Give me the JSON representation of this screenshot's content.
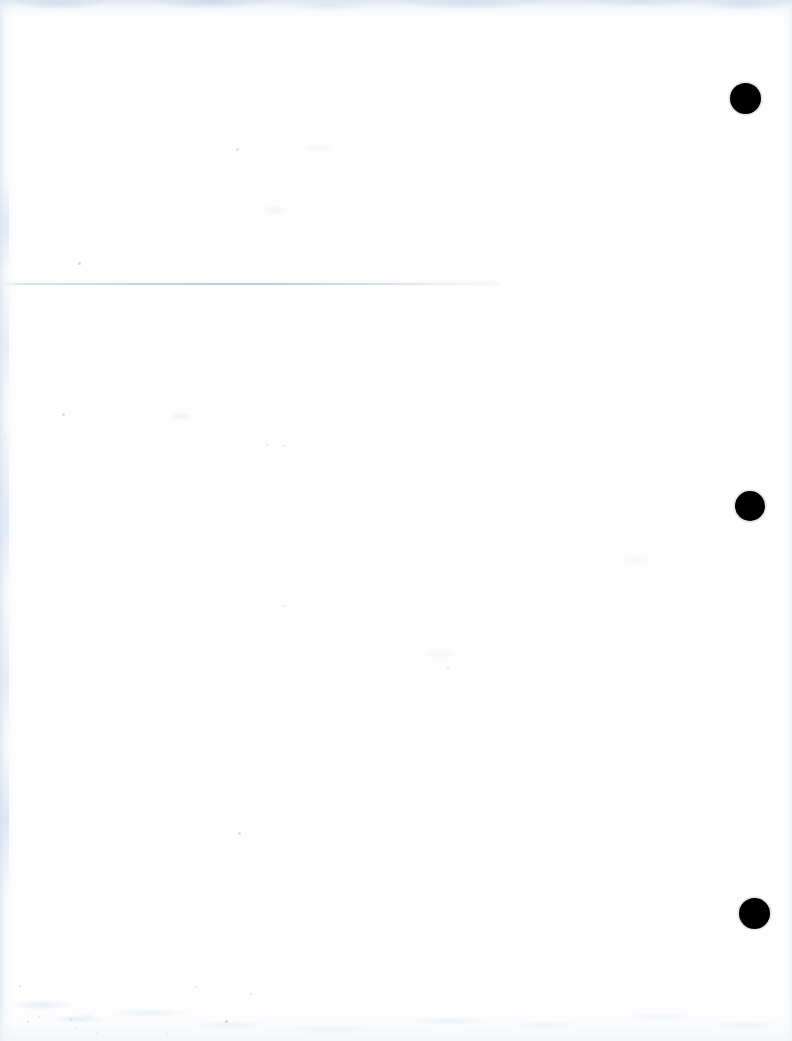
{
  "document": {
    "title": "Scanned Blank Page",
    "page_width": 792,
    "page_height": 1041,
    "background_color": "#ffffff",
    "paper_color": "#fefeff",
    "content_text": "",
    "description": "Blank scanned document page with three black binding marks along the right margin and a faint horizontal fold crease across the upper third."
  },
  "marks": {
    "ink_color": "#000000",
    "registration_dots": [
      {
        "id": "dot-1",
        "label": "",
        "cx": 745,
        "cy": 98,
        "diameter": 31
      },
      {
        "id": "dot-2",
        "label": "",
        "cx": 750,
        "cy": 506,
        "diameter": 30
      },
      {
        "id": "dot-3",
        "label": "",
        "cx": 754,
        "cy": 913,
        "diameter": 31
      }
    ],
    "crease_line": {
      "id": "crease-1",
      "label": "",
      "x": 0,
      "y": 283,
      "width": 500,
      "color": "#b7bdcd"
    }
  },
  "scan_artifacts": {
    "edge_shadow_color": "#d8e0ec",
    "top_edge_height": 26,
    "left_edge_width": 14,
    "right_edge_width": 10,
    "bottom_edge_height": 48,
    "specks": [
      {
        "x": 27,
        "y": 1021,
        "size": 2,
        "opacity": 0.22
      },
      {
        "x": 38,
        "y": 1016,
        "size": 2,
        "opacity": 0.18
      },
      {
        "x": 69,
        "y": 1018,
        "size": 3,
        "opacity": 0.2
      },
      {
        "x": 74,
        "y": 1027,
        "size": 2,
        "opacity": 0.16
      },
      {
        "x": 96,
        "y": 1032,
        "size": 2,
        "opacity": 0.15
      },
      {
        "x": 225,
        "y": 1020,
        "size": 3,
        "opacity": 0.34
      },
      {
        "x": 87,
        "y": 1015,
        "size": 2,
        "opacity": 0.2
      },
      {
        "x": 166,
        "y": 1033,
        "size": 2,
        "opacity": 0.14
      },
      {
        "x": 62,
        "y": 413,
        "size": 3,
        "opacity": 0.17
      },
      {
        "x": 78,
        "y": 262,
        "size": 3,
        "opacity": 0.2
      },
      {
        "x": 236,
        "y": 148,
        "size": 3,
        "opacity": 0.14
      },
      {
        "x": 238,
        "y": 832,
        "size": 3,
        "opacity": 0.17
      },
      {
        "x": 4,
        "y": 436,
        "size": 2,
        "opacity": 0.16
      },
      {
        "x": 266,
        "y": 444,
        "size": 2,
        "opacity": 0.12
      },
      {
        "x": 283,
        "y": 445,
        "size": 2,
        "opacity": 0.12
      },
      {
        "x": 447,
        "y": 667,
        "size": 2,
        "opacity": 0.12
      },
      {
        "x": 283,
        "y": 605,
        "size": 2,
        "opacity": 0.11
      },
      {
        "x": 19,
        "y": 985,
        "size": 2,
        "opacity": 0.14
      },
      {
        "x": 195,
        "y": 986,
        "size": 2,
        "opacity": 0.12
      },
      {
        "x": 250,
        "y": 993,
        "size": 2,
        "opacity": 0.11
      }
    ]
  }
}
